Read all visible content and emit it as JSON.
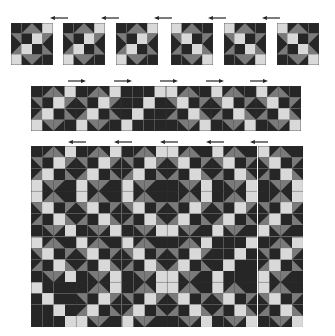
{
  "colors": {
    "dark": "#262626",
    "gray": "#7a7a7a",
    "white": "#d9d9d9",
    "border": "#333333"
  },
  "patterns": {
    "A": [
      "D",
      "tDG_lr",
      "tDG_ll",
      "W",
      "tDG_ur",
      "D",
      "W",
      "tDG_ul",
      "tDG_lr",
      "W",
      "D",
      "tDG_ll",
      "W",
      "tDG_ur",
      "tDG_ul",
      "D"
    ],
    "B": [
      "W",
      "tDG_lr",
      "tDG_ll",
      "D",
      "tDG_ur",
      "W",
      "D",
      "tDG_ul",
      "tDG_lr",
      "D",
      "W",
      "tDG_ll",
      "D",
      "tDG_ur",
      "tDG_ul",
      "W"
    ],
    "Ap": [
      "D",
      "D",
      "D",
      "W",
      "D",
      "D",
      "W",
      "D",
      "D",
      "W",
      "D",
      "D",
      "W",
      "D",
      "D",
      "D"
    ],
    "Bp": [
      "W",
      "D",
      "D",
      "D",
      "D",
      "W",
      "D",
      "D",
      "D",
      "D",
      "W",
      "D",
      "D",
      "D",
      "D",
      "W"
    ]
  },
  "rows": [
    {
      "name": "single-blocks",
      "x": [
        11,
        63,
        116,
        171,
        224,
        277
      ],
      "y": 23,
      "size": 42,
      "gap": true,
      "blocks": [
        "A",
        "A",
        "A",
        "B",
        "B",
        "B"
      ],
      "arrows": {
        "dir": "left",
        "y": 16,
        "x": [
          50,
          101,
          154,
          208,
          262
        ]
      }
    },
    {
      "name": "strip",
      "x0": 31,
      "y": 86,
      "size": 45,
      "cols": 6,
      "rowsN": 1,
      "blocks": [
        [
          "A",
          "A",
          "Ap",
          "B",
          "B",
          "B"
        ]
      ],
      "arrows": {
        "dir": "right",
        "y": 79,
        "x": [
          68,
          114,
          160,
          206,
          250
        ]
      }
    },
    {
      "name": "full-quilt",
      "x0": 31,
      "y": 146,
      "size": 45.3,
      "cols": 6,
      "rowsN": 4,
      "blocks": [
        [
          "A",
          "A",
          "A",
          "B",
          "B",
          "B"
        ],
        [
          "B",
          "B",
          "B",
          "A",
          "A",
          "A"
        ],
        [
          "B",
          "B",
          "B",
          "A",
          "Ap",
          "A"
        ],
        [
          "Bp",
          "A",
          "A",
          "B",
          "B",
          "B"
        ]
      ],
      "arrows": {
        "dir": "left",
        "y": 140,
        "x": [
          68,
          114,
          160,
          206,
          250
        ]
      }
    }
  ]
}
